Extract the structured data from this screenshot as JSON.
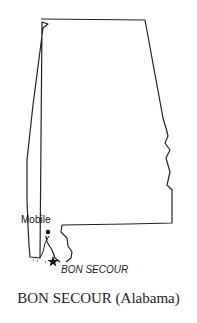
{
  "map": {
    "region": "Alabama",
    "labels": {
      "city": "Mobile",
      "site": "BON SECOUR"
    },
    "markers": [
      {
        "name": "Mobile",
        "type": "dot"
      },
      {
        "name": "BON SECOUR",
        "type": "star"
      }
    ],
    "colors": {
      "outline": "#222222",
      "background": "#ffffff"
    }
  },
  "caption": "BON SECOUR (Alabama)"
}
